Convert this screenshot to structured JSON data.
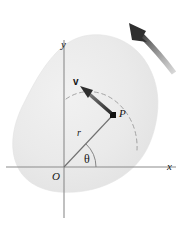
{
  "figure": {
    "type": "physics-diagram",
    "background_color": "#ffffff",
    "body_fill_color": "#ebebeb",
    "axis_color": "#8c8c8c",
    "line_color": "#6e6e6e",
    "ink_color": "#161616"
  },
  "labels": {
    "y_axis": "y",
    "x_axis": "x",
    "origin": "O",
    "point": "P",
    "radius": "r",
    "angle": "θ",
    "velocity": "v"
  },
  "geometry": {
    "origin": {
      "x": 64,
      "y": 167
    },
    "point_p": {
      "x": 113,
      "y": 115
    },
    "radius_px": 71,
    "theta_degrees": 47,
    "x_axis_span": [
      6,
      176
    ],
    "y_axis_span": [
      40,
      218
    ],
    "velocity_arrow_tail": {
      "x": 110,
      "y": 112
    },
    "velocity_arrow_tip": {
      "x": 83,
      "y": 88
    },
    "rotation_arrow_tail": {
      "x": 173,
      "y": 72
    },
    "rotation_arrow_tip": {
      "x": 131,
      "y": 25
    }
  },
  "label_positions": {
    "y_axis": {
      "x": 61,
      "y": 39
    },
    "x_axis": {
      "x": 167,
      "y": 161
    },
    "origin": {
      "x": 52,
      "y": 171
    },
    "point": {
      "x": 119,
      "y": 108
    },
    "radius": {
      "x": 77,
      "y": 128
    },
    "angle": {
      "x": 84,
      "y": 153
    },
    "velocity": {
      "x": 73,
      "y": 77
    }
  }
}
